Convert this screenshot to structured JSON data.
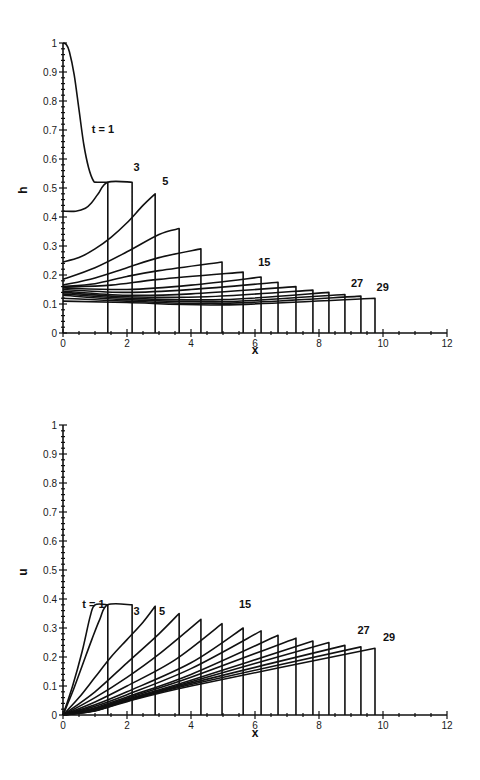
{
  "chart_data": [
    {
      "type": "line",
      "title": "",
      "xlabel": "x",
      "ylabel": "h",
      "xlim": [
        0,
        12
      ],
      "ylim": [
        0,
        1
      ],
      "xticks": [
        0,
        2,
        4,
        6,
        8,
        10,
        12
      ],
      "xtick_labels": [
        "0",
        "2",
        "4",
        "6",
        "8",
        "10",
        "12"
      ],
      "yticks": [
        0,
        0.1,
        0.2,
        0.3,
        0.4,
        0.5,
        0.6,
        0.7,
        0.8,
        0.9,
        1
      ],
      "ytick_labels": [
        "0",
        "0.1",
        "0.2",
        "0.3",
        "0.4",
        "0.5",
        "0.6",
        "0.7",
        "0.8",
        "0.9",
        "1"
      ],
      "grid": false,
      "legend": "none",
      "annotations": [
        {
          "text": "t = 1",
          "x": 0.9,
          "y": 0.69
        },
        {
          "text": "3",
          "x": 2.2,
          "y": 0.56
        },
        {
          "text": "5",
          "x": 3.1,
          "y": 0.51
        },
        {
          "text": "15",
          "x": 6.1,
          "y": 0.23
        },
        {
          "text": "27",
          "x": 9.0,
          "y": 0.16
        },
        {
          "text": "29",
          "x": 9.8,
          "y": 0.145
        }
      ],
      "series": [
        {
          "name": "t=1",
          "points": [
            [
              0,
              1.0
            ],
            [
              0.1,
              0.995
            ],
            [
              0.2,
              0.97
            ],
            [
              0.35,
              0.89
            ],
            [
              0.5,
              0.77
            ],
            [
              0.65,
              0.65
            ],
            [
              0.8,
              0.57
            ],
            [
              0.95,
              0.525
            ],
            [
              1.05,
              0.52
            ],
            [
              1.4,
              0.52
            ]
          ],
          "shock_x": 1.4
        },
        {
          "name": "t=3",
          "points": [
            [
              0,
              0.42
            ],
            [
              0.4,
              0.42
            ],
            [
              0.7,
              0.43
            ],
            [
              0.9,
              0.45
            ],
            [
              1.1,
              0.48
            ],
            [
              1.4,
              0.52
            ],
            [
              2.16,
              0.52
            ]
          ],
          "shock_x": 2.16
        },
        {
          "name": "t=5",
          "points": [
            [
              0,
              0.245
            ],
            [
              0.5,
              0.26
            ],
            [
              1.0,
              0.29
            ],
            [
              1.5,
              0.33
            ],
            [
              2.0,
              0.38
            ],
            [
              2.5,
              0.44
            ],
            [
              2.88,
              0.48
            ]
          ],
          "shock_x": 2.88
        },
        {
          "name": "t=7",
          "points": [
            [
              0,
              0.185
            ],
            [
              1.0,
              0.225
            ],
            [
              2.0,
              0.28
            ],
            [
              3.0,
              0.34
            ],
            [
              3.63,
              0.36
            ]
          ],
          "shock_x": 3.63
        },
        {
          "name": "t=9",
          "points": [
            [
              0,
              0.165
            ],
            [
              1.0,
              0.19
            ],
            [
              2.0,
              0.225
            ],
            [
              3.0,
              0.26
            ],
            [
              4.31,
              0.29
            ]
          ],
          "shock_x": 4.31
        },
        {
          "name": "t=11",
          "points": [
            [
              0,
              0.16
            ],
            [
              1.0,
              0.17
            ],
            [
              2.0,
              0.195
            ],
            [
              3.0,
              0.215
            ],
            [
              4.97,
              0.245
            ]
          ],
          "shock_x": 4.97
        },
        {
          "name": "t=13",
          "points": [
            [
              0,
              0.158
            ],
            [
              1.5,
              0.165
            ],
            [
              3.0,
              0.185
            ],
            [
              5.63,
              0.21
            ]
          ],
          "shock_x": 5.63
        },
        {
          "name": "t=15",
          "points": [
            [
              0,
              0.155
            ],
            [
              2.0,
              0.15
            ],
            [
              4.0,
              0.165
            ],
            [
              6.19,
              0.193
            ]
          ],
          "shock_x": 6.19
        },
        {
          "name": "t=17",
          "points": [
            [
              0,
              0.15
            ],
            [
              2.0,
              0.14
            ],
            [
              4.0,
              0.15
            ],
            [
              6.72,
              0.175
            ]
          ],
          "shock_x": 6.72
        },
        {
          "name": "t=19",
          "points": [
            [
              0,
              0.145
            ],
            [
              2.0,
              0.13
            ],
            [
              4.0,
              0.135
            ],
            [
              7.28,
              0.16
            ]
          ],
          "shock_x": 7.28
        },
        {
          "name": "t=21",
          "points": [
            [
              0,
              0.14
            ],
            [
              2.0,
              0.125
            ],
            [
              4.5,
              0.125
            ],
            [
              7.81,
              0.148
            ]
          ],
          "shock_x": 7.81
        },
        {
          "name": "t=23",
          "points": [
            [
              0,
              0.135
            ],
            [
              2.0,
              0.12
            ],
            [
              5.0,
              0.115
            ],
            [
              8.31,
              0.14
            ]
          ],
          "shock_x": 8.31
        },
        {
          "name": "t=25",
          "points": [
            [
              0,
              0.13
            ],
            [
              2.0,
              0.115
            ],
            [
              5.0,
              0.108
            ],
            [
              8.81,
              0.133
            ]
          ],
          "shock_x": 8.81
        },
        {
          "name": "t=27",
          "points": [
            [
              0,
              0.12
            ],
            [
              2.0,
              0.11
            ],
            [
              5.0,
              0.102
            ],
            [
              9.31,
              0.127
            ]
          ],
          "shock_x": 9.31
        },
        {
          "name": "t=29",
          "points": [
            [
              0,
              0.11
            ],
            [
              2.0,
              0.105
            ],
            [
              5.0,
              0.097
            ],
            [
              9.75,
              0.12
            ]
          ],
          "shock_x": 9.75
        }
      ]
    },
    {
      "type": "line",
      "title": "",
      "xlabel": "x",
      "ylabel": "u",
      "xlim": [
        0,
        12
      ],
      "ylim": [
        0,
        1
      ],
      "xticks": [
        0,
        2,
        4,
        6,
        8,
        10,
        12
      ],
      "xtick_labels": [
        "0",
        "2",
        "4",
        "6",
        "8",
        "10",
        "12"
      ],
      "yticks": [
        0,
        0.1,
        0.2,
        0.3,
        0.4,
        0.5,
        0.6,
        0.7,
        0.8,
        0.9,
        1
      ],
      "ytick_labels": [
        "0",
        "0.1",
        "0.2",
        "0.3",
        "0.4",
        "0.5",
        "0.6",
        "0.7",
        "0.8",
        "0.9",
        "1"
      ],
      "grid": false,
      "legend": "none",
      "annotations": [
        {
          "text": "t = 1",
          "x": 0.6,
          "y": 0.37
        },
        {
          "text": "3",
          "x": 2.2,
          "y": 0.345
        },
        {
          "text": "5",
          "x": 3.0,
          "y": 0.345
        },
        {
          "text": "15",
          "x": 5.5,
          "y": 0.37
        },
        {
          "text": "27",
          "x": 9.2,
          "y": 0.28
        },
        {
          "text": "29",
          "x": 10.0,
          "y": 0.255
        }
      ],
      "series": [
        {
          "name": "t=1",
          "points": [
            [
              0,
              0
            ],
            [
              0.3,
              0.1
            ],
            [
              0.6,
              0.22
            ],
            [
              0.85,
              0.34
            ],
            [
              1.0,
              0.38
            ],
            [
              1.4,
              0.38
            ]
          ],
          "shock_x": 1.4
        },
        {
          "name": "t=3",
          "points": [
            [
              0,
              0
            ],
            [
              0.3,
              0.08
            ],
            [
              0.6,
              0.17
            ],
            [
              0.9,
              0.26
            ],
            [
              1.15,
              0.33
            ],
            [
              1.4,
              0.38
            ],
            [
              2.16,
              0.38
            ]
          ],
          "shock_x": 2.16
        },
        {
          "name": "t=5",
          "points": [
            [
              0,
              0
            ],
            [
              0.5,
              0.06
            ],
            [
              1.0,
              0.13
            ],
            [
              1.5,
              0.2
            ],
            [
              2.0,
              0.26
            ],
            [
              2.5,
              0.32
            ],
            [
              2.88,
              0.375
            ]
          ],
          "shock_x": 2.88
        },
        {
          "name": "t=7",
          "points": [
            [
              0,
              0
            ],
            [
              1.0,
              0.08
            ],
            [
              2.0,
              0.18
            ],
            [
              3.0,
              0.28
            ],
            [
              3.63,
              0.35
            ]
          ],
          "shock_x": 3.63
        },
        {
          "name": "t=9",
          "points": [
            [
              0,
              0
            ],
            [
              1.0,
              0.06
            ],
            [
              2.0,
              0.13
            ],
            [
              3.0,
              0.21
            ],
            [
              4.31,
              0.33
            ]
          ],
          "shock_x": 4.31
        },
        {
          "name": "t=11",
          "points": [
            [
              0,
              0
            ],
            [
              1.0,
              0.045
            ],
            [
              2.0,
              0.1
            ],
            [
              3.5,
              0.19
            ],
            [
              4.97,
              0.315
            ]
          ],
          "shock_x": 4.97
        },
        {
          "name": "t=13",
          "points": [
            [
              0,
              0
            ],
            [
              1.0,
              0.035
            ],
            [
              2.0,
              0.08
            ],
            [
              4.0,
              0.18
            ],
            [
              5.63,
              0.3
            ]
          ],
          "shock_x": 5.63
        },
        {
          "name": "t=15",
          "points": [
            [
              0,
              0
            ],
            [
              1.0,
              0.03
            ],
            [
              2.0,
              0.07
            ],
            [
              4.0,
              0.16
            ],
            [
              6.19,
              0.29
            ]
          ],
          "shock_x": 6.19
        },
        {
          "name": "t=17",
          "points": [
            [
              0,
              0
            ],
            [
              1.0,
              0.025
            ],
            [
              2.0,
              0.062
            ],
            [
              4.0,
              0.14
            ],
            [
              6.72,
              0.275
            ]
          ],
          "shock_x": 6.72
        },
        {
          "name": "t=19",
          "points": [
            [
              0,
              0
            ],
            [
              1.0,
              0.022
            ],
            [
              2.0,
              0.058
            ],
            [
              4.0,
              0.13
            ],
            [
              7.28,
              0.265
            ]
          ],
          "shock_x": 7.28
        },
        {
          "name": "t=21",
          "points": [
            [
              0,
              0
            ],
            [
              1.0,
              0.02
            ],
            [
              2.0,
              0.055
            ],
            [
              4.0,
              0.12
            ],
            [
              7.81,
              0.255
            ]
          ],
          "shock_x": 7.81
        },
        {
          "name": "t=23",
          "points": [
            [
              0,
              0
            ],
            [
              1.0,
              0.018
            ],
            [
              2.0,
              0.052
            ],
            [
              4.0,
              0.115
            ],
            [
              8.31,
              0.25
            ]
          ],
          "shock_x": 8.31
        },
        {
          "name": "t=25",
          "points": [
            [
              0,
              0
            ],
            [
              1.0,
              0.016
            ],
            [
              2.0,
              0.05
            ],
            [
              4.0,
              0.11
            ],
            [
              8.81,
              0.24
            ]
          ],
          "shock_x": 8.81
        },
        {
          "name": "t=27",
          "points": [
            [
              0,
              0
            ],
            [
              1.0,
              0.015
            ],
            [
              2.0,
              0.048
            ],
            [
              4.0,
              0.105
            ],
            [
              9.31,
              0.235
            ]
          ],
          "shock_x": 9.31
        },
        {
          "name": "t=29",
          "points": [
            [
              0,
              0
            ],
            [
              1.0,
              0.014
            ],
            [
              2.0,
              0.046
            ],
            [
              4.0,
              0.1
            ],
            [
              9.75,
              0.23
            ]
          ],
          "shock_x": 9.75
        }
      ]
    }
  ],
  "layout": {
    "plots": [
      {
        "x0": 63,
        "y0": 333,
        "px_per_x": 32,
        "px_per_y": 290,
        "ylabel_pos": [
          27,
          190
        ],
        "xlabel_pos": [
          255,
          354
        ]
      },
      {
        "x0": 63,
        "y0": 715,
        "px_per_x": 32,
        "px_per_y": 290,
        "ylabel_pos": [
          27,
          572
        ],
        "xlabel_pos": [
          255,
          737
        ]
      }
    ]
  }
}
